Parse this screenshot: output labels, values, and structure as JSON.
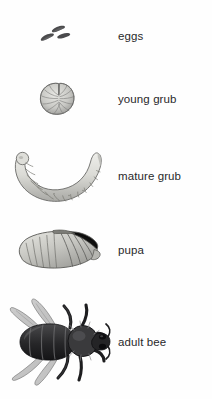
{
  "diagram": {
    "background_color": "#fefefe",
    "label_color": "#29292b",
    "art_color_dark": "#3a3a3c",
    "art_color_mid": "#8e8e90",
    "art_color_light": "#dcdcd8"
  },
  "stages": [
    {
      "id": "eggs",
      "label": "eggs",
      "art": "three-small-elongated-dark-eggs-clustered-slanted"
    },
    {
      "id": "young-grub",
      "label": "young grub",
      "art": "small-curled-c-shaped-segmented-larva"
    },
    {
      "id": "mature-grub",
      "label": "mature grub",
      "art": "large-crescent-shaped-segmented-larva"
    },
    {
      "id": "pupa",
      "label": "pupa",
      "art": "oval-pupa-with-diagonal-wing-pads-and-banding"
    },
    {
      "id": "adult-bee",
      "label": "adult bee",
      "art": "dorsal-view-dark-adult-honey-bee-with-wings-and-legs"
    }
  ]
}
